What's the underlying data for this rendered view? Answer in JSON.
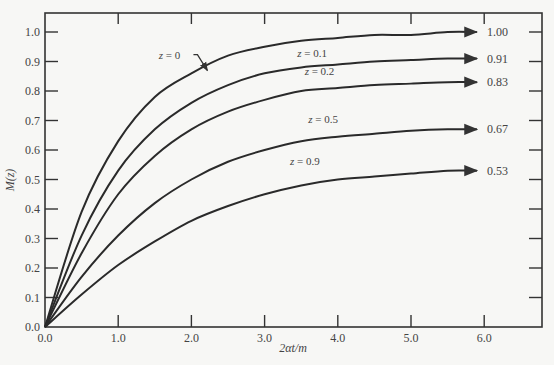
{
  "chart_data": {
    "type": "line",
    "title": "",
    "xlabel": "2αt/m",
    "ylabel": "M(z)",
    "xlim": [
      0,
      6.8
    ],
    "ylim": [
      0,
      1.06
    ],
    "grid": false,
    "x_ticks": [
      "0.0",
      "1.0",
      "2.0",
      "3.0",
      "4.0",
      "5.0",
      "6.0"
    ],
    "y_ticks": [
      "0.0",
      "0.1",
      "0.2",
      "0.3",
      "0.4",
      "0.5",
      "0.6",
      "0.7",
      "0.8",
      "0.9",
      "1.0"
    ],
    "x": [
      0,
      0.5,
      1.0,
      1.5,
      2.0,
      2.5,
      3.0,
      3.5,
      4.0,
      4.5,
      5.0,
      5.5,
      5.9
    ],
    "series": [
      {
        "name": "z = 0",
        "end_label": "1.00",
        "values": [
          0,
          0.39,
          0.63,
          0.78,
          0.86,
          0.92,
          0.95,
          0.97,
          0.98,
          0.99,
          0.99,
          1.0,
          1.0
        ]
      },
      {
        "name": "z = 0.1",
        "end_label": "0.91",
        "values": [
          0,
          0.31,
          0.53,
          0.67,
          0.76,
          0.82,
          0.86,
          0.88,
          0.89,
          0.9,
          0.905,
          0.91,
          0.91
        ]
      },
      {
        "name": "z = 0.2",
        "end_label": "0.83",
        "values": [
          0,
          0.25,
          0.45,
          0.58,
          0.67,
          0.73,
          0.77,
          0.8,
          0.81,
          0.82,
          0.825,
          0.83,
          0.83
        ]
      },
      {
        "name": "z = 0.5",
        "end_label": "0.67",
        "values": [
          0,
          0.17,
          0.31,
          0.42,
          0.5,
          0.56,
          0.6,
          0.63,
          0.645,
          0.655,
          0.665,
          0.67,
          0.67
        ]
      },
      {
        "name": "z = 0.9",
        "end_label": "0.53",
        "values": [
          0,
          0.11,
          0.21,
          0.29,
          0.36,
          0.41,
          0.45,
          0.48,
          0.5,
          0.51,
          0.52,
          0.53,
          0.53
        ]
      }
    ],
    "annotations": [
      {
        "text": "z = 0",
        "x": 1.7,
        "y": 0.91,
        "arrow": true
      },
      {
        "text": "z = 0.1",
        "x": 3.65,
        "y": 0.915
      },
      {
        "text": "z = 0.2",
        "x": 3.75,
        "y": 0.855
      },
      {
        "text": "z = 0.5",
        "x": 3.8,
        "y": 0.69
      },
      {
        "text": "z = 0.9",
        "x": 3.55,
        "y": 0.55
      }
    ]
  }
}
